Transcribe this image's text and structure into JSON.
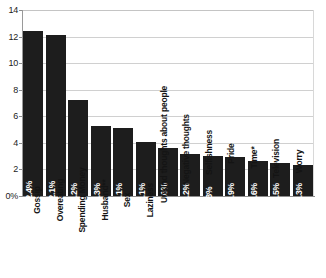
{
  "chart_data": {
    "type": "bar",
    "title": "",
    "subtitle": "",
    "xlabel": "",
    "ylabel": "",
    "ylim": [
      0,
      14
    ],
    "grid": true,
    "legend": null,
    "orientation": "vertical",
    "bar_color": "#1d1d1d",
    "value_label_color": "#ffffff",
    "gridline_color": "#d0d0d0",
    "background_color": "#ffffff",
    "categories": [
      "Gossip",
      "Overeating",
      "Spending Money",
      "Husband**",
      "Sex",
      "Laziness",
      "Unkind thoughts about people",
      "Negative thoughts",
      "Selfishness",
      "Pride",
      "Time*",
      "Television",
      "Worry"
    ],
    "values": [
      12.4,
      12.1,
      7.2,
      5.3,
      5.1,
      4.1,
      3.6,
      3.2,
      3.0,
      2.9,
      2.6,
      2.5,
      2.3
    ],
    "data_labels": [
      "12.4%",
      "12.1%",
      "7.2%",
      "5.3%",
      "5.1%",
      "4.1%",
      "3.6%",
      "3.2%",
      "3%",
      "2.9%",
      "2.6%",
      "2.5%",
      "2.3%"
    ],
    "category_label_placement": [
      "below",
      "below",
      "below",
      "below",
      "below",
      "below",
      "inside",
      "inside",
      "inside",
      "inside",
      "inside",
      "inside",
      "inside"
    ],
    "yticks": [
      {
        "value": 14,
        "label": "14"
      },
      {
        "value": 12,
        "label": "12"
      },
      {
        "value": 10,
        "label": "10"
      },
      {
        "value": 8,
        "label": "8"
      },
      {
        "value": 6,
        "label": "6"
      },
      {
        "value": 4,
        "label": "4"
      },
      {
        "value": 2,
        "label": "2"
      },
      {
        "value": 0,
        "label": "0%"
      }
    ]
  }
}
